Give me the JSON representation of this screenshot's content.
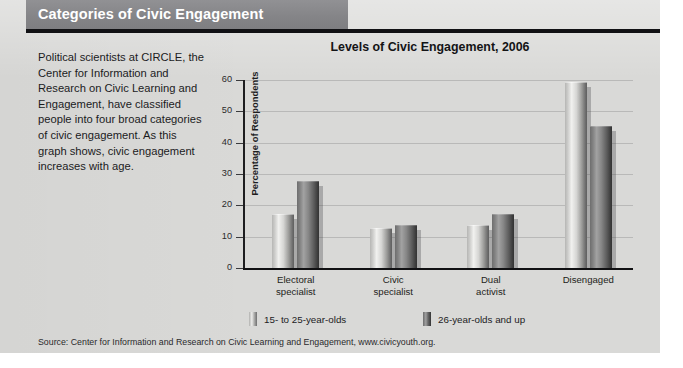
{
  "header": {
    "title": "Categories of Civic Engagement"
  },
  "intro": {
    "paragraph": "Political scientists at CIRCLE, the Center for Information and Research on Civic Learning and Engagement, have classified people into four broad categories of civic engagement. As this graph shows, civic engagement increases with age."
  },
  "source": {
    "text": "Source: Center for Information and Research on Civic Learning and Engagement, www.civicyouth.org."
  },
  "colors": {
    "banner": "#87878a",
    "banner_text": "#ffffff",
    "rule": "#111114",
    "page_background": "#d9d9d7",
    "series_1_light": "#f1f1ef",
    "series_1_dark": "#5e5e5e",
    "series_2_light": "#a2a2a2",
    "series_2_dark": "#333333",
    "axis": "#1d1d1f",
    "text": "#1b1b1d"
  },
  "chart_data": {
    "type": "bar",
    "title": "Levels of Civic Engagement, 2006",
    "xlabel": "",
    "ylabel": "Percentage of Respondents",
    "ylim": [
      0,
      60
    ],
    "yticks": [
      0,
      10,
      20,
      30,
      40,
      50,
      60
    ],
    "ytick_labels": [
      "0",
      "10",
      "20",
      "30",
      "40",
      "50",
      "60"
    ],
    "grid": true,
    "legend_position": "bottom",
    "categories": [
      "Electoral\nspecialist",
      "Civic\nspecialist",
      "Dual\nactivist",
      "Disengaged"
    ],
    "category_labels_flat": [
      "Electoral specialist",
      "Civic specialist",
      "Dual activist",
      "Disengaged"
    ],
    "series": [
      {
        "name": "15- to 25-year-olds",
        "values": [
          17,
          12.5,
          13.5,
          59
        ]
      },
      {
        "name": "26-year-olds and up",
        "values": [
          27.5,
          13.5,
          17,
          45
        ]
      }
    ]
  }
}
